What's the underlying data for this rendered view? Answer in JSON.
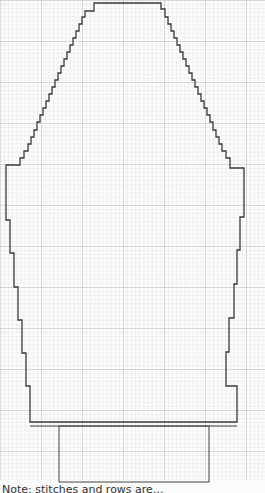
{
  "diagram": {
    "type": "knitting-chart-schematic",
    "grid": {
      "minor_spacing_px": 4.1,
      "major_every": 10,
      "minor_color": "#d9d9d9",
      "major_color": "#bdbdbd"
    },
    "outline_color": "#3a3a3a",
    "pieces": [
      {
        "name": "body-with-raglan-shaping",
        "description": "Stepped trapezoid top tapering into straight-ish body with stepped sides"
      },
      {
        "name": "ribbing-band",
        "description": "Narrower rectangle beneath the body"
      }
    ],
    "caption": "Note: stitches and rows are..."
  }
}
